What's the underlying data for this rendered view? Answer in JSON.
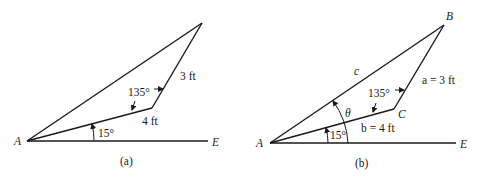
{
  "figure": {
    "panels": [
      {
        "id": "a",
        "caption": "(a)",
        "points": {
          "A": "A",
          "E": "E"
        },
        "labels": {
          "side_AC": "4 ft",
          "side_CB": "3 ft",
          "angle_C": "135°",
          "angle_A": "15°"
        }
      },
      {
        "id": "b",
        "caption": "(b)",
        "points": {
          "A": "A",
          "B": "B",
          "C": "C",
          "E": "E"
        },
        "labels": {
          "side_c": "c",
          "side_a": "a = 3 ft",
          "side_b": "b = 4 ft",
          "angle_C": "135°",
          "angle_A": "15°",
          "angle_theta": "θ"
        }
      }
    ]
  }
}
